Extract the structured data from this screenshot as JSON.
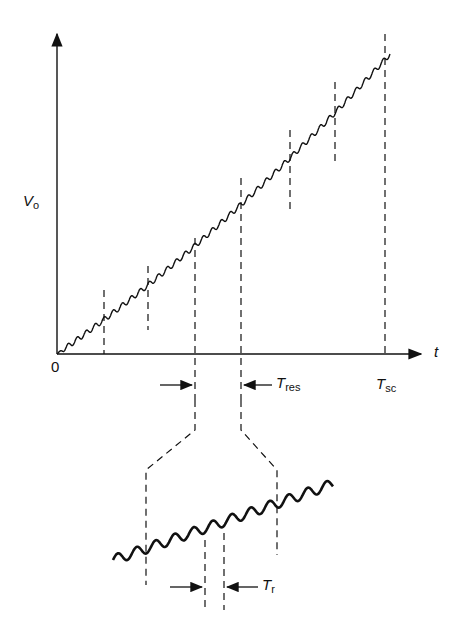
{
  "diagram": {
    "y_axis_label": "V",
    "y_axis_sub": "o",
    "x_axis_label": "t",
    "origin_label": "0",
    "t_res_label": "T",
    "t_res_sub": "res",
    "t_sc_label": "T",
    "t_sc_sub": "sc",
    "t_r_label": "T",
    "t_r_sub": "r",
    "colors": {
      "ink": "#111111",
      "background": "#ffffff"
    }
  }
}
